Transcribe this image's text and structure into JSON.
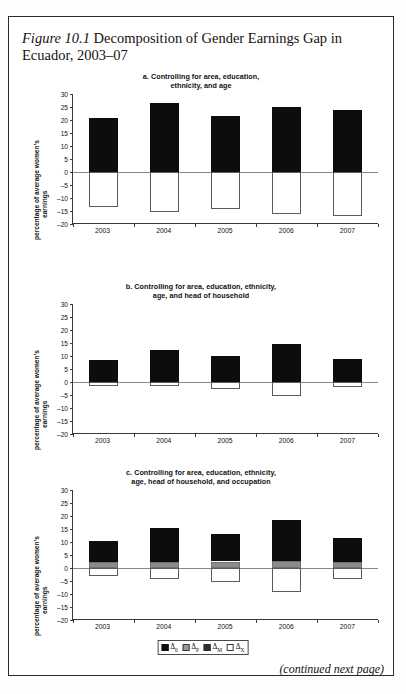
{
  "figure": {
    "label": "Figure 10.1",
    "title": " Decomposition of Gender Earnings Gap in Ecuador, 2003–07",
    "continued_note": "(continued next page)"
  },
  "axis": {
    "ylabel_line1": "percentage of average women’s",
    "ylabel_line2": "earnings",
    "ytick_labels": [
      "30",
      "25",
      "20",
      "15",
      "10",
      "5",
      "0",
      "–5",
      "–10",
      "–15",
      "–20"
    ],
    "ymin": -20,
    "ymax": 30,
    "ystep": 5
  },
  "legend": {
    "items": [
      {
        "name": "delta-0",
        "swatch": "black",
        "symbol": "Δ",
        "subscript": "0"
      },
      {
        "name": "delta-p",
        "swatch": "gray",
        "symbol": "Δ",
        "subscript": "P"
      },
      {
        "name": "delta-m",
        "swatch": "dark",
        "symbol": "Δ",
        "subscript": "M"
      },
      {
        "name": "delta-x",
        "swatch": "white",
        "symbol": "Δ",
        "subscript": "X"
      }
    ]
  },
  "chart_data": [
    {
      "type": "bar",
      "panel": "a",
      "title": "a. Controlling for area, education,\nethnicity, and age",
      "title_line1": "a. Controlling for area, education,",
      "title_line2": "ethnicity, and age",
      "categories": [
        "2003",
        "2004",
        "2005",
        "2006",
        "2007"
      ],
      "xlabel": "",
      "ylabel": "percentage of average women’s earnings",
      "ylim": [
        -20,
        30
      ],
      "grid": false,
      "legend_position": "bottom",
      "series": [
        {
          "name": "Δ0",
          "color": "#0d0d0d",
          "values": [
            20.8,
            26.5,
            21.7,
            25.0,
            23.7
          ]
        },
        {
          "name": "ΔP",
          "color": "#8c8c8c",
          "values": [
            0,
            0,
            0,
            0,
            0
          ]
        },
        {
          "name": "ΔX",
          "color": "#ffffff",
          "values": [
            -13.4,
            -15.2,
            -14.1,
            -16.2,
            -16.9
          ]
        }
      ]
    },
    {
      "type": "bar",
      "panel": "b",
      "title": "b. Controlling for area, education, ethnicity,\nage, and head of household",
      "title_line1": "b. Controlling for area, education, ethnicity,",
      "title_line2": "age, and head of household",
      "categories": [
        "2003",
        "2004",
        "2005",
        "2006",
        "2007"
      ],
      "xlabel": "",
      "ylabel": "percentage of average women’s earnings",
      "ylim": [
        -20,
        30
      ],
      "grid": false,
      "legend_position": "bottom",
      "series": [
        {
          "name": "Δ0",
          "color": "#0d0d0d",
          "values": [
            8.5,
            12.5,
            10.0,
            14.5,
            8.8
          ]
        },
        {
          "name": "ΔP",
          "color": "#8c8c8c",
          "values": [
            0,
            0,
            0,
            0,
            0
          ]
        },
        {
          "name": "ΔX",
          "color": "#ffffff",
          "values": [
            -1.5,
            -1.5,
            -2.5,
            -5.3,
            -2.0
          ]
        }
      ]
    },
    {
      "type": "bar",
      "panel": "c",
      "title": "c. Controlling for area, education, ethnicity,\nage, head of household, and occupation",
      "title_line1": "c. Controlling for area, education, ethnicity,",
      "title_line2": "age, head of household, and occupation",
      "categories": [
        "2003",
        "2004",
        "2005",
        "2006",
        "2007"
      ],
      "xlabel": "",
      "ylabel": "percentage of average women’s earnings",
      "ylim": [
        -20,
        30
      ],
      "grid": false,
      "legend_position": "bottom",
      "series": [
        {
          "name": "Δ0",
          "color": "#0d0d0d",
          "values": [
            10.5,
            15.3,
            13.2,
            18.3,
            11.4
          ]
        },
        {
          "name": "ΔP",
          "color": "#8c8c8c",
          "values": [
            2.3,
            2.3,
            2.5,
            2.7,
            2.2
          ]
        },
        {
          "name": "ΔX",
          "color": "#ffffff",
          "values": [
            -3.0,
            -4.2,
            -5.5,
            -9.3,
            -4.3
          ]
        }
      ]
    }
  ]
}
